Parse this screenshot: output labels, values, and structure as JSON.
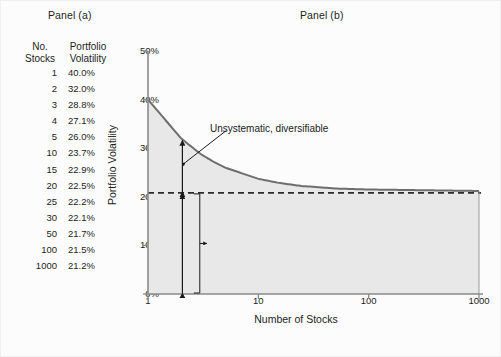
{
  "figure": {
    "panel_a_caption": "Panel (a)",
    "panel_b_caption": "Panel (b)"
  },
  "table": {
    "header_col1_line1": "No.",
    "header_col1_line2": "Stocks",
    "header_col2_line1": "Portfolio",
    "header_col2_line2": "Volatility",
    "rows": [
      {
        "stocks": "1",
        "volatility": "40.0%"
      },
      {
        "stocks": "2",
        "volatility": "32.0%"
      },
      {
        "stocks": "3",
        "volatility": "28.8%"
      },
      {
        "stocks": "4",
        "volatility": "27.1%"
      },
      {
        "stocks": "5",
        "volatility": "26.0%"
      },
      {
        "stocks": "10",
        "volatility": "23.7%"
      },
      {
        "stocks": "15",
        "volatility": "22.9%"
      },
      {
        "stocks": "20",
        "volatility": "22.5%"
      },
      {
        "stocks": "25",
        "volatility": "22.2%"
      },
      {
        "stocks": "30",
        "volatility": "22.1%"
      },
      {
        "stocks": "50",
        "volatility": "21.7%"
      },
      {
        "stocks": "100",
        "volatility": "21.5%"
      },
      {
        "stocks": "1000",
        "volatility": "21.2%"
      }
    ]
  },
  "chart_data": {
    "type": "line",
    "title": "Panel (b)",
    "xlabel": "Number of Stocks",
    "ylabel": "Portfolio Volatility",
    "xscale": "log",
    "xlim": [
      1,
      1000
    ],
    "ylim": [
      0,
      50
    ],
    "grid": false,
    "legend": "none",
    "xticks": [
      "1",
      "10",
      "100",
      "1000"
    ],
    "xtick_values": [
      1,
      10,
      100,
      1000
    ],
    "yticks": [
      "0%",
      "10%",
      "20%",
      "30%",
      "40%",
      "50%"
    ],
    "ytick_values": [
      0,
      10,
      20,
      30,
      40,
      50
    ],
    "series": [
      {
        "name": "Portfolio Volatility",
        "x": [
          1,
          2,
          3,
          4,
          5,
          10,
          15,
          20,
          25,
          30,
          50,
          100,
          1000
        ],
        "values": [
          40.0,
          32.0,
          28.8,
          27.1,
          26.0,
          23.7,
          22.9,
          22.5,
          22.2,
          22.1,
          21.7,
          21.5,
          21.2
        ]
      }
    ],
    "reference_line": {
      "name": "Systematic risk floor",
      "style": "dashed",
      "y": 20.8
    },
    "annotations": [
      {
        "text": "Unsystematic, diversifiable",
        "kind": "arrow-label"
      },
      {
        "text": "Systematic, non-diversifiable",
        "kind": "brace-label"
      }
    ],
    "colors": {
      "curve": "#6e6e6e",
      "fill": "#e8e8e8",
      "axis": "#8a8a8a",
      "dashed": "#2b2b2b",
      "background": "#fcfcfc"
    }
  }
}
